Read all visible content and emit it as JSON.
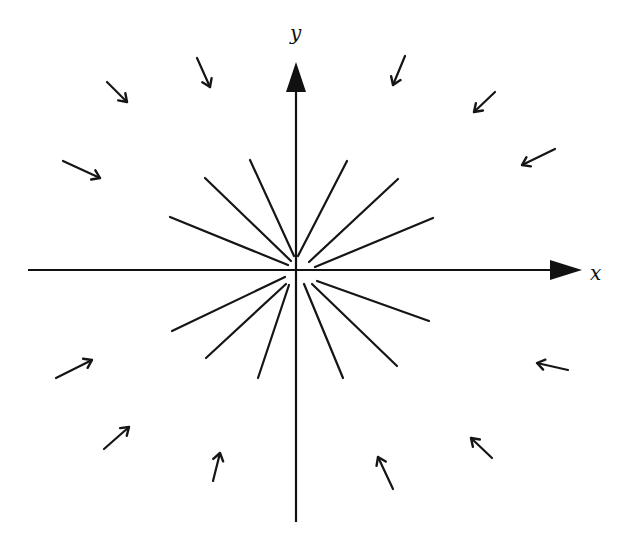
{
  "diagram": {
    "axes": {
      "x": {
        "label": "x",
        "from": [
          28,
          270
        ],
        "to": [
          582,
          270
        ],
        "label_pos": [
          590,
          280
        ]
      },
      "y": {
        "label": "y",
        "from": [
          296,
          522
        ],
        "to": [
          296,
          62
        ],
        "label_pos": [
          290,
          40
        ]
      }
    },
    "origin": [
      296,
      270
    ],
    "rays": [
      {
        "id": "ray-ul-1",
        "x1": 170,
        "y1": 217,
        "x2": 288,
        "y2": 265
      },
      {
        "id": "ray-ul-2",
        "x1": 205,
        "y1": 178,
        "x2": 291,
        "y2": 261
      },
      {
        "id": "ray-ul-3",
        "x1": 250,
        "y1": 160,
        "x2": 294,
        "y2": 256
      },
      {
        "id": "ray-ur-1",
        "x1": 347,
        "y1": 161,
        "x2": 298,
        "y2": 256
      },
      {
        "id": "ray-ur-2",
        "x1": 398,
        "y1": 179,
        "x2": 309,
        "y2": 262
      },
      {
        "id": "ray-ur-3",
        "x1": 433,
        "y1": 218,
        "x2": 315,
        "y2": 267
      },
      {
        "id": "ray-lr-1",
        "x1": 429,
        "y1": 321,
        "x2": 317,
        "y2": 281
      },
      {
        "id": "ray-lr-2",
        "x1": 397,
        "y1": 366,
        "x2": 312,
        "y2": 284
      },
      {
        "id": "ray-lr-3",
        "x1": 343,
        "y1": 378,
        "x2": 304,
        "y2": 284
      },
      {
        "id": "ray-ll-1",
        "x1": 258,
        "y1": 378,
        "x2": 289,
        "y2": 285
      },
      {
        "id": "ray-ll-2",
        "x1": 206,
        "y1": 358,
        "x2": 286,
        "y2": 284
      },
      {
        "id": "ray-ll-3",
        "x1": 172,
        "y1": 331,
        "x2": 285,
        "y2": 277
      }
    ],
    "inward_arrows": [
      {
        "id": "arrow-top-far-left",
        "tail": [
          107,
          82
        ],
        "tip": [
          127,
          102
        ]
      },
      {
        "id": "arrow-top-left",
        "tail": [
          197,
          58
        ],
        "tip": [
          210,
          87
        ]
      },
      {
        "id": "arrow-top-right",
        "tail": [
          405,
          56
        ],
        "tip": [
          393,
          85
        ]
      },
      {
        "id": "arrow-top-far-right",
        "tail": [
          495,
          92
        ],
        "tip": [
          474,
          112
        ]
      },
      {
        "id": "arrow-left-upper",
        "tail": [
          63,
          161
        ],
        "tip": [
          100,
          178
        ]
      },
      {
        "id": "arrow-right-upper",
        "tail": [
          555,
          149
        ],
        "tip": [
          522,
          165
        ]
      },
      {
        "id": "arrow-left-lower",
        "tail": [
          56,
          378
        ],
        "tip": [
          92,
          360
        ]
      },
      {
        "id": "arrow-right-lower",
        "tail": [
          568,
          370
        ],
        "tip": [
          537,
          363
        ]
      },
      {
        "id": "arrow-bottom-far-left",
        "tail": [
          104,
          449
        ],
        "tip": [
          129,
          427
        ]
      },
      {
        "id": "arrow-bottom-left",
        "tail": [
          213,
          481
        ],
        "tip": [
          220,
          453
        ]
      },
      {
        "id": "arrow-bottom-right",
        "tail": [
          393,
          489
        ],
        "tip": [
          378,
          457
        ]
      },
      {
        "id": "arrow-bottom-far-right",
        "tail": [
          492,
          458
        ],
        "tip": [
          471,
          438
        ]
      }
    ]
  }
}
